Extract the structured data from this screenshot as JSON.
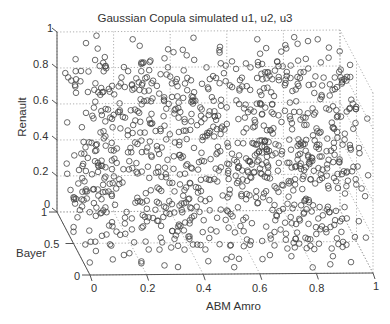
{
  "chart_data": {
    "type": "scatter3d",
    "title": "Gaussian Copula simulated u1, u2, u3",
    "xlabel": "ABM Amro",
    "ylabel": "Bayer",
    "zlabel": "Renault",
    "xlim": [
      0,
      1
    ],
    "ylim": [
      0,
      1
    ],
    "zlim": [
      0,
      1
    ],
    "x_ticks": [
      "0",
      "0.2",
      "0.4",
      "0.6",
      "0.8",
      "1"
    ],
    "y_ticks": [
      "0",
      "0.5",
      "1"
    ],
    "z_ticks": [
      "0",
      "0.2",
      "0.4",
      "0.6",
      "0.8",
      "1"
    ],
    "grid": true,
    "marker": "open-circle",
    "marker_color": "#444444",
    "n_points_approx": 1000,
    "distribution": "approximately uniform on unit cube (Gaussian copula samples)",
    "series": [
      {
        "name": "u1,u2,u3",
        "sample_points": [
          {
            "x": 0.05,
            "y": 0.9,
            "z": 0.85
          },
          {
            "x": 0.15,
            "y": 0.7,
            "z": 0.92
          },
          {
            "x": 0.3,
            "y": 0.5,
            "z": 0.6
          },
          {
            "x": 0.45,
            "y": 0.3,
            "z": 0.4
          },
          {
            "x": 0.6,
            "y": 0.8,
            "z": 0.75
          },
          {
            "x": 0.75,
            "y": 0.2,
            "z": 0.3
          },
          {
            "x": 0.9,
            "y": 0.6,
            "z": 0.55
          },
          {
            "x": 0.5,
            "y": 0.1,
            "z": 0.05
          },
          {
            "x": 0.2,
            "y": 0.4,
            "z": 0.2
          },
          {
            "x": 0.85,
            "y": 0.95,
            "z": 0.97
          }
        ]
      }
    ]
  },
  "labels": {
    "title": "Gaussian Copula simulated u1, u2, u3",
    "xlabel": "ABM Amro",
    "ylabel": "Bayer",
    "zlabel": "Renault"
  },
  "colors": {
    "axis": "#555555",
    "grid": "#9a9a9a",
    "marker": "#444444",
    "text": "#333333"
  }
}
